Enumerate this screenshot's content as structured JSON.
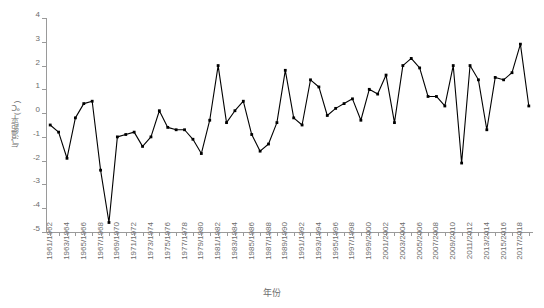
{
  "chart": {
    "ylabel": "气温距平(℃)",
    "xlabel": "年份"
  },
  "chart_data": {
    "type": "line",
    "title": "",
    "subtitle": "",
    "xlabel": "年份",
    "ylabel": "气温距平(℃)",
    "ylim": [
      -5,
      4
    ],
    "yticks": [
      -5,
      -4,
      -3,
      -2,
      -1,
      0,
      1,
      2,
      3,
      4
    ],
    "grid": false,
    "legend": "none",
    "marker": "filled-square",
    "line_color": "#000000",
    "categories": [
      "1961/1962",
      "1962/1963",
      "1963/1964",
      "1964/1965",
      "1965/1966",
      "1966/1967",
      "1967/1968",
      "1968/1969",
      "1969/1970",
      "1970/1971",
      "1971/1972",
      "1972/1973",
      "1973/1974",
      "1974/1975",
      "1975/1976",
      "1976/1977",
      "1977/1978",
      "1978/1979",
      "1979/1980",
      "1980/1981",
      "1981/1982",
      "1982/1983",
      "1983/1984",
      "1984/1985",
      "1985/1986",
      "1986/1987",
      "1987/1988",
      "1988/1989",
      "1989/1990",
      "1990/1991",
      "1991/1992",
      "1992/1993",
      "1993/1994",
      "1994/1995",
      "1995/1996",
      "1996/1997",
      "1997/1998",
      "1998/1999",
      "1999/2000",
      "2000/2001",
      "2001/2002",
      "2002/2003",
      "2003/2004",
      "2004/2005",
      "2005/2006",
      "2006/2007",
      "2007/2008",
      "2008/2009",
      "2009/2010",
      "2010/2011",
      "2011/2012",
      "2012/2013",
      "2013/2014",
      "2014/2015",
      "2015/2016",
      "2016/2017",
      "2017/2018",
      "2018/2019"
    ],
    "tick_labels": [
      "1961/1962",
      "1963/1964",
      "1965/1966",
      "1967/1968",
      "1969/1970",
      "1971/1972",
      "1973/1974",
      "1975/1976",
      "1977/1978",
      "1979/1980",
      "1981/1982",
      "1983/1984",
      "1985/1986",
      "1987/1988",
      "1989/1990",
      "1991/1992",
      "1993/1994",
      "1995/1996",
      "1997/1998",
      "1999/2000",
      "2001/2002",
      "2003/2004",
      "2005/2006",
      "2007/2008",
      "2009/2010",
      "2011/2012",
      "2013/2014",
      "2015/2016",
      "2017/2018"
    ],
    "values": [
      -0.5,
      -0.8,
      -1.9,
      -0.2,
      0.4,
      0.5,
      -2.4,
      -4.6,
      -1.0,
      -0.9,
      -0.8,
      -1.4,
      -1.0,
      0.1,
      -0.6,
      -0.7,
      -0.7,
      -1.1,
      -1.7,
      -0.3,
      2.0,
      -0.4,
      0.1,
      0.5,
      -0.9,
      -1.6,
      -1.3,
      -0.4,
      1.8,
      -0.2,
      -0.5,
      1.4,
      1.1,
      -0.1,
      0.2,
      0.4,
      0.6,
      -0.3,
      1.0,
      0.8,
      1.6,
      -0.4,
      2.0,
      2.3,
      1.9,
      0.7,
      0.7,
      0.3,
      2.0,
      -2.1,
      2.0,
      1.4,
      -0.7,
      1.5,
      1.4,
      1.7,
      2.9,
      0.3
    ]
  }
}
